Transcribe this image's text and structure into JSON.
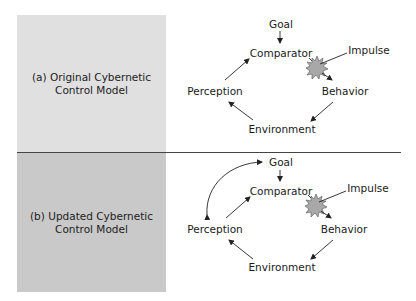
{
  "panels": [
    {
      "id": "a",
      "label_line1": "(a) Original Cybernetic",
      "label_line2": "Control Model",
      "nodes": {
        "goal": "Goal",
        "comparator": "Comparator",
        "impulse": "Impulse",
        "behavior": "Behavior",
        "environment": "Environment",
        "perception": "Perception"
      }
    },
    {
      "id": "b",
      "label_line1": "(b) Updated Cybernetic",
      "label_line2": "Control Model",
      "nodes": {
        "goal": "Goal",
        "comparator": "Comparator",
        "impulse": "Impulse",
        "behavior": "Behavior",
        "environment": "Environment",
        "perception": "Perception"
      }
    }
  ],
  "colors": {
    "panel_a_bg": "#e0e0e0",
    "panel_b_bg": "#c9c9c9",
    "starburst_fill": "#a8a8a8",
    "line": "#222222"
  }
}
